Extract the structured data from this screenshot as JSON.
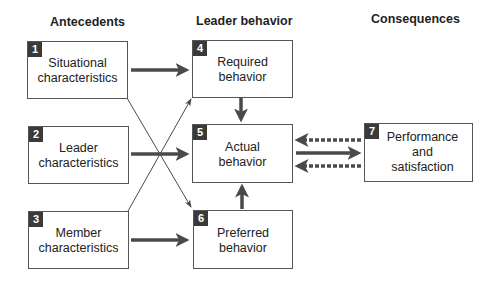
{
  "headings": {
    "antecedents": "Antecedents",
    "leader_behavior": "Leader behavior",
    "consequences": "Consequences"
  },
  "boxes": [
    {
      "number": "1",
      "line1": "Situational",
      "line2": "characteristics",
      "line3": ""
    },
    {
      "number": "2",
      "line1": "Leader",
      "line2": "characteristics",
      "line3": ""
    },
    {
      "number": "3",
      "line1": "Member",
      "line2": "characteristics",
      "line3": ""
    },
    {
      "number": "4",
      "line1": "Required",
      "line2": "behavior",
      "line3": ""
    },
    {
      "number": "5",
      "line1": "Actual",
      "line2": "behavior",
      "line3": ""
    },
    {
      "number": "6",
      "line1": "Preferred",
      "line2": "behavior",
      "line3": ""
    },
    {
      "number": "7",
      "line1": "Performance",
      "line2": "and",
      "line3": "satisfaction"
    }
  ],
  "connections": [
    {
      "from": "1",
      "to": "4",
      "style": "solid-thick"
    },
    {
      "from": "2",
      "to": "5",
      "style": "solid-thick"
    },
    {
      "from": "3",
      "to": "6",
      "style": "solid-thick"
    },
    {
      "from": "1",
      "to": "6",
      "style": "thin"
    },
    {
      "from": "3",
      "to": "4",
      "style": "thin"
    },
    {
      "from": "4",
      "to": "5",
      "style": "solid-thick"
    },
    {
      "from": "6",
      "to": "5",
      "style": "solid-thick"
    },
    {
      "from": "5",
      "to": "7",
      "style": "solid-thick"
    },
    {
      "from": "7",
      "to": "5",
      "style": "dashed-thick"
    },
    {
      "from": "7",
      "to": "5",
      "style": "dashed-thick"
    }
  ],
  "colors": {
    "arrow": "#4a4a4a",
    "badge": "#3a3a3a",
    "border": "#555555"
  }
}
